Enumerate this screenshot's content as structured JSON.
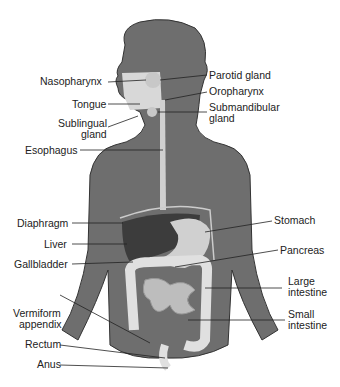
{
  "diagram": {
    "type": "anatomical-illustration",
    "colors": {
      "skin": "#6e6e6e",
      "organ_light": "#d8d8d8",
      "liver": "#3c3c3c",
      "leader": "#222222"
    },
    "labels_left": [
      {
        "id": "nasopharynx",
        "text": "Nasopharynx"
      },
      {
        "id": "tongue",
        "text": "Tongue"
      },
      {
        "id": "sublingual",
        "text": "Sublingual",
        "text2": "gland"
      },
      {
        "id": "esophagus",
        "text": "Esophagus"
      },
      {
        "id": "diaphragm",
        "text": "Diaphragm"
      },
      {
        "id": "liver",
        "text": "Liver"
      },
      {
        "id": "gallbladder",
        "text": "Gallbladder"
      },
      {
        "id": "appendix",
        "text": "Vermiform",
        "text2": "appendix"
      },
      {
        "id": "rectum",
        "text": "Rectum"
      },
      {
        "id": "anus",
        "text": "Anus"
      }
    ],
    "labels_right": [
      {
        "id": "parotid",
        "text": "Parotid gland"
      },
      {
        "id": "oropharynx",
        "text": "Oropharynx"
      },
      {
        "id": "submandibular",
        "text": "Submandibular",
        "text2": "gland"
      },
      {
        "id": "stomach",
        "text": "Stomach"
      },
      {
        "id": "pancreas",
        "text": "Pancreas"
      },
      {
        "id": "large_intestine",
        "text": "Large",
        "text2": "intestine"
      },
      {
        "id": "small_intestine",
        "text": "Small",
        "text2": "intestine"
      }
    ]
  }
}
